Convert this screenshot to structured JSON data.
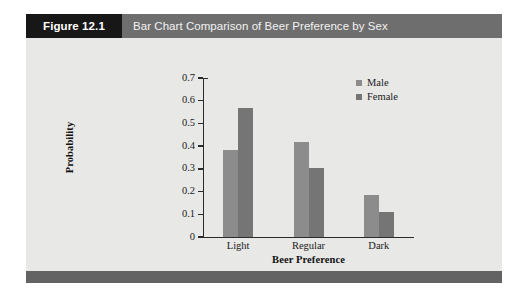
{
  "figure": {
    "number_label": "Figure 12.1",
    "title": "Bar Chart Comparison of Beer Preference by Sex",
    "header_number_bg": "#171717",
    "header_title_bg": "#6e6e6e",
    "body_bg": "#e8e8e6",
    "footer_bg": "#636363"
  },
  "chart_data": {
    "type": "bar",
    "title": "",
    "categories": [
      "Light",
      "Regular",
      "Dark"
    ],
    "series": [
      {
        "name": "Male",
        "color": "#8c8c8c",
        "values": [
          0.385,
          0.42,
          0.185
        ]
      },
      {
        "name": "Female",
        "color": "#757575",
        "values": [
          0.57,
          0.305,
          0.11
        ]
      }
    ],
    "xlabel": "Beer Preference",
    "ylabel": "Probability",
    "ylim": [
      0,
      0.7
    ],
    "ytick_values": [
      0,
      0.1,
      0.2,
      0.3,
      0.4,
      0.5,
      0.6,
      0.7
    ],
    "ytick_labels": [
      "0",
      "0.1",
      "0.2",
      "0.3",
      "0.4",
      "0.5",
      "0.6",
      "0.7"
    ],
    "grid": false,
    "legend_position": "top-right",
    "axis_color": "#2b2b2b"
  }
}
